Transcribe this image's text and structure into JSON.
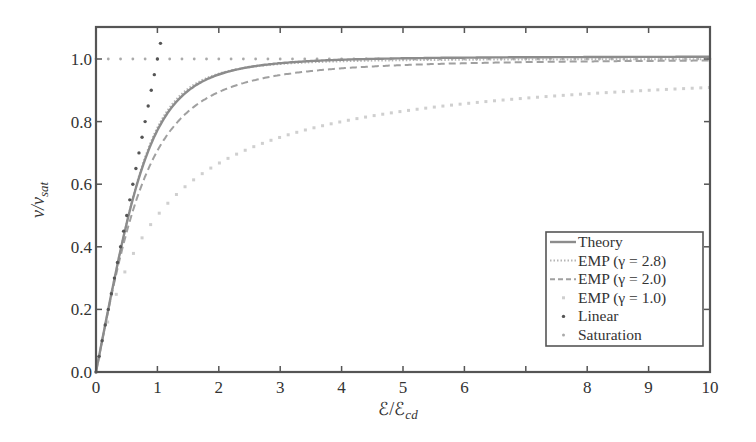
{
  "chart_data": {
    "type": "line",
    "title": "",
    "xlabel": "ℰ/ℰcd",
    "xlabel_main": "ℰ/ℰ",
    "xlabel_sub": "cd",
    "ylabel": "v/vsat",
    "ylabel_main": "v/v",
    "ylabel_sub": "sat",
    "xlim": [
      0,
      10
    ],
    "ylim": [
      0,
      1.1
    ],
    "x_ticks": [
      0,
      1,
      2,
      3,
      4,
      5,
      6,
      7,
      8,
      9,
      10
    ],
    "x_tick_labels": [
      "0",
      "1",
      "2",
      "3",
      "4",
      "5",
      "6",
      "",
      "8",
      "9",
      "10"
    ],
    "y_ticks": [
      0.0,
      0.2,
      0.4,
      0.6,
      0.8,
      1.0
    ],
    "y_tick_labels": [
      "0.0",
      "0.2",
      "0.4",
      "0.6",
      "0.8",
      "1.0"
    ],
    "grid": false,
    "legend_position": "lower right",
    "x": [
      0,
      0.25,
      0.5,
      0.75,
      1,
      1.25,
      1.5,
      2,
      2.5,
      3,
      4,
      5,
      6,
      7,
      8,
      9,
      10
    ],
    "series": [
      {
        "name": "Theory",
        "style": "solid",
        "color": "#8c8c8c",
        "values": [
          0,
          0.25,
          0.49,
          0.69,
          0.82,
          0.895,
          0.935,
          0.975,
          0.995,
          1.003,
          1.006,
          1.007,
          1.008,
          1.008,
          1.008,
          1.008,
          1.008
        ]
      },
      {
        "name": "EMP (γ = 2.8)",
        "style": "dotted",
        "color": "#b5b5b5",
        "gamma": 2.8,
        "values": [
          0,
          0.249,
          0.486,
          0.683,
          0.78,
          0.87,
          0.92,
          0.965,
          0.983,
          0.991,
          0.996,
          0.998,
          0.999,
          0.999,
          1.0,
          1.0,
          1.0
        ]
      },
      {
        "name": "EMP (γ = 2.0)",
        "style": "dashed",
        "color": "#a0a0a0",
        "gamma": 2.0,
        "values": [
          0,
          0.243,
          0.447,
          0.6,
          0.707,
          0.781,
          0.832,
          0.894,
          0.928,
          0.949,
          0.97,
          0.981,
          0.986,
          0.99,
          0.992,
          0.994,
          0.995
        ]
      },
      {
        "name": "EMP (γ = 1.0)",
        "style": "sparse-dots",
        "color": "#c8c8c8",
        "gamma": 1.0,
        "values": [
          0,
          0.2,
          0.333,
          0.429,
          0.5,
          0.556,
          0.6,
          0.667,
          0.714,
          0.75,
          0.8,
          0.833,
          0.857,
          0.875,
          0.889,
          0.9,
          0.909
        ]
      },
      {
        "name": "Linear",
        "style": "dots",
        "color": "#555555",
        "values_note": "v/vsat = ℰ/ℰcd, shown from 0 to ~1.05"
      },
      {
        "name": "Saturation",
        "style": "dots",
        "color": "#aaaaaa",
        "values_note": "v/vsat = 1.0 constant"
      }
    ]
  },
  "legend": {
    "items": [
      {
        "label": "Theory",
        "style": "solid"
      },
      {
        "label": "EMP (γ = 2.8)",
        "style": "dotted"
      },
      {
        "label": "EMP (γ = 2.0)",
        "style": "dashed"
      },
      {
        "label": "EMP (γ = 1.0)",
        "style": "sparse-dot"
      },
      {
        "label": "Linear",
        "style": "dot-dark"
      },
      {
        "label": "Saturation",
        "style": "dot-light"
      }
    ]
  }
}
